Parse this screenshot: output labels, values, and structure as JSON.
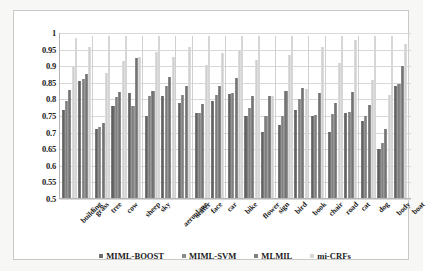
{
  "chart_data": {
    "type": "bar",
    "title": "",
    "xlabel": "",
    "ylabel": "",
    "ylim": [
      0.5,
      1.0
    ],
    "yticks": [
      "0.5",
      "0.55",
      "0.6",
      "0.65",
      "0.7",
      "0.75",
      "0.8",
      "0.85",
      "0.9",
      "0.95",
      "1"
    ],
    "grid": true,
    "legend_position": "bottom",
    "categories": [
      "building",
      "grass",
      "tree",
      "cow",
      "sheep",
      "sky",
      "aeroplane",
      "water",
      "face",
      "car",
      "bike",
      "flower",
      "sign",
      "bird",
      "book",
      "chair",
      "road",
      "cat",
      "dog",
      "body",
      "boat"
    ],
    "series": [
      {
        "name": "MIML-BOOST",
        "color": "#6e6e6e",
        "values": [
          0.768,
          0.855,
          0.708,
          0.778,
          0.818,
          0.75,
          0.808,
          0.788,
          0.758,
          0.795,
          0.815,
          0.75,
          0.7,
          0.722,
          0.768,
          0.75,
          0.7,
          0.758,
          0.732,
          0.65,
          0.84
        ]
      },
      {
        "name": "MIML-SVM",
        "color": "#8b8b8b",
        "values": [
          0.795,
          0.86,
          0.715,
          0.805,
          0.778,
          0.808,
          0.84,
          0.812,
          0.758,
          0.812,
          0.818,
          0.772,
          0.748,
          0.748,
          0.8,
          0.752,
          0.755,
          0.762,
          0.75,
          0.668,
          0.845
        ]
      },
      {
        "name": "MLMIL",
        "color": "#7f7f7f",
        "values": [
          0.828,
          0.875,
          0.728,
          0.82,
          0.925,
          0.825,
          0.868,
          0.84,
          0.785,
          0.838,
          0.865,
          0.808,
          0.808,
          0.825,
          0.832,
          0.818,
          0.788,
          0.82,
          0.782,
          0.71,
          0.9
        ]
      },
      {
        "name": "mi-CRFs",
        "color": "#d6d6d6",
        "values": [
          0.897,
          0.958,
          0.878,
          0.915,
          0.928,
          0.942,
          0.928,
          0.958,
          0.902,
          0.938,
          0.95,
          0.918,
          0.81,
          0.932,
          0.83,
          0.958,
          0.908,
          0.98,
          0.858,
          0.812,
          0.968
        ]
      }
    ],
    "overflow_markers": {
      "note": "tallest light bars reach the top gridline at 1",
      "values": [
        0.985,
        0.99,
        0.99,
        0.99,
        0.99,
        0.99,
        0.99,
        0.99,
        0.99,
        0.99,
        0.99,
        0.99,
        0.99,
        0.99,
        0.99,
        0.99,
        0.99,
        0.99,
        0.99,
        0.99,
        0.99
      ]
    }
  },
  "legend": {
    "items": [
      {
        "label": "MIML-BOOST",
        "color": "#6e6e6e"
      },
      {
        "label": "MIML-SVM",
        "color": "#8b8b8b"
      },
      {
        "label": "MLMIL",
        "color": "#7f7f7f"
      },
      {
        "label": "mi-CRFs",
        "color": "#d6d6d6"
      }
    ]
  }
}
